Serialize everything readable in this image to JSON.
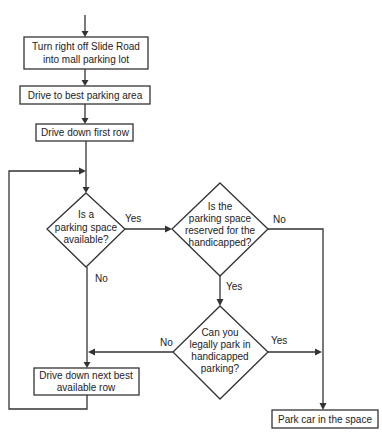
{
  "diagram": {
    "type": "flowchart",
    "nodes": {
      "turn_right": {
        "shape": "process",
        "lines": [
          "Turn right off Slide Road",
          "into mall parking lot"
        ]
      },
      "best_area": {
        "shape": "process",
        "lines": [
          "Drive to best parking area"
        ]
      },
      "first_row": {
        "shape": "process",
        "lines": [
          "Drive down first row"
        ]
      },
      "space_available": {
        "shape": "decision",
        "lines": [
          "Is a",
          "parking space",
          "available?"
        ]
      },
      "reserved_handicapped": {
        "shape": "decision",
        "lines": [
          "Is the",
          "parking space",
          "reserved for the",
          "handicapped?"
        ]
      },
      "legally_park": {
        "shape": "decision",
        "lines": [
          "Can you",
          "legally park in",
          "handicapped",
          "parking?"
        ]
      },
      "next_row": {
        "shape": "process",
        "lines": [
          "Drive down next best",
          "available row"
        ]
      },
      "park_car": {
        "shape": "process",
        "lines": [
          "Park car in the space"
        ]
      }
    },
    "edge_labels": {
      "space_available_yes": "Yes",
      "space_available_no": "No",
      "reserved_no": "No",
      "reserved_yes": "Yes",
      "legally_no": "No",
      "legally_yes": "Yes"
    },
    "edges": [
      {
        "from": "start",
        "to": "turn_right"
      },
      {
        "from": "turn_right",
        "to": "best_area"
      },
      {
        "from": "best_area",
        "to": "first_row"
      },
      {
        "from": "first_row",
        "to": "space_available"
      },
      {
        "from": "space_available",
        "to": "reserved_handicapped",
        "label": "Yes"
      },
      {
        "from": "space_available",
        "to": "next_row",
        "label": "No"
      },
      {
        "from": "reserved_handicapped",
        "to": "park_car",
        "label": "No"
      },
      {
        "from": "reserved_handicapped",
        "to": "legally_park",
        "label": "Yes"
      },
      {
        "from": "legally_park",
        "to": "next_row",
        "label": "No"
      },
      {
        "from": "legally_park",
        "to": "park_car",
        "label": "Yes"
      },
      {
        "from": "next_row",
        "to": "space_available"
      }
    ]
  }
}
